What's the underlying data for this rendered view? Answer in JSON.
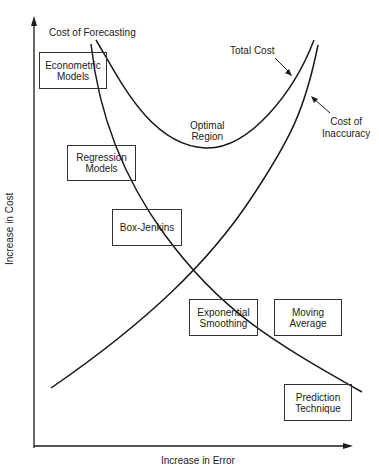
{
  "diagram": {
    "axes": {
      "x_label": "Increase in Error",
      "y_label": "Increase in Cost"
    },
    "curves": {
      "cost_of_forecasting": "Cost of Forecasting",
      "total_cost": "Total Cost",
      "cost_of_inaccuracy_line1": "Cost of",
      "cost_of_inaccuracy_line2": "Inaccuracy",
      "optimal_region_line1": "Optimal",
      "optimal_region_line2": "Region"
    },
    "boxes": [
      {
        "line1": "Econometric",
        "line2": "Models"
      },
      {
        "line1": "Regression",
        "line2": "Models"
      },
      {
        "line1": "Box-Jenkins",
        "line2": ""
      },
      {
        "line1": "Exponential",
        "line2": "Smoothing"
      },
      {
        "line1": "Moving",
        "line2": "Average"
      },
      {
        "line1": "Prediction",
        "line2": "Technique"
      }
    ],
    "colors": {
      "line": "#1a1a1a",
      "background": "#ffffff"
    }
  }
}
